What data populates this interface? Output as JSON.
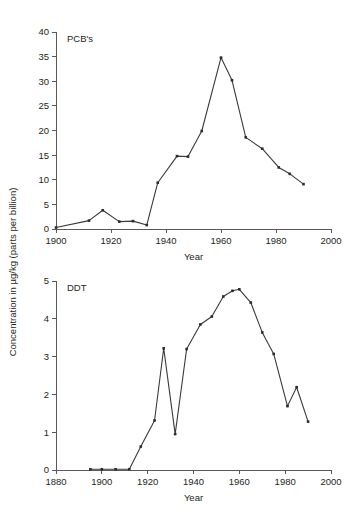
{
  "figure": {
    "y_axis_title": "Concentration in µg/kg (parts per billion)",
    "x_axis_title_top": "Year",
    "x_axis_title_bottom": "Year",
    "line_color": "#3a3a3a",
    "axis_color": "#595959",
    "text_color": "#231f20",
    "background": "#ffffff"
  },
  "chart_data": [
    {
      "type": "line",
      "title": "PCB's",
      "xlabel": "Year",
      "ylabel": "Concentration in µg/kg (parts per billion)",
      "xlim": [
        1900,
        2000
      ],
      "ylim": [
        0,
        40
      ],
      "xticks": [
        1900,
        1920,
        1940,
        1960,
        1980,
        2000
      ],
      "yticks": [
        0,
        5,
        10,
        15,
        20,
        25,
        30,
        35,
        40
      ],
      "xtick_labels": [
        "1900",
        "1920",
        "1940",
        "1960",
        "1980",
        "2000"
      ],
      "ytick_labels": [
        "0",
        "5",
        "10",
        "15",
        "20",
        "25",
        "30",
        "35",
        "40"
      ],
      "grid": false,
      "legend": "none",
      "markers": true,
      "series": [
        {
          "name": "PCB's",
          "x": [
            1900,
            1912,
            1917,
            1923,
            1928,
            1933,
            1937,
            1944,
            1948,
            1953,
            1960,
            1964,
            1969,
            1975,
            1981,
            1985,
            1990
          ],
          "y": [
            0.3,
            1.7,
            3.8,
            1.5,
            1.6,
            0.8,
            9.4,
            14.8,
            14.7,
            19.9,
            34.8,
            30.2,
            18.6,
            16.3,
            12.5,
            11.2,
            9.1
          ]
        }
      ]
    },
    {
      "type": "line",
      "title": "DDT",
      "xlabel": "Year",
      "ylabel": "Concentration in µg/kg (parts per billion)",
      "xlim": [
        1880,
        2000
      ],
      "ylim": [
        0,
        5
      ],
      "xticks": [
        1880,
        1900,
        1920,
        1940,
        1960,
        1980,
        2000
      ],
      "yticks": [
        0,
        1,
        2,
        3,
        4,
        5
      ],
      "xtick_labels": [
        "1880",
        "1900",
        "1920",
        "1940",
        "1960",
        "1980",
        "2000"
      ],
      "ytick_labels": [
        "0",
        "1",
        "2",
        "3",
        "4",
        "5"
      ],
      "grid": false,
      "legend": "none",
      "markers": true,
      "series": [
        {
          "name": "DDT",
          "x": [
            1895,
            1900,
            1906,
            1912,
            1917,
            1923,
            1927,
            1932,
            1937,
            1943,
            1948,
            1953,
            1957,
            1960,
            1965,
            1970,
            1975,
            1981,
            1985,
            1990
          ],
          "y": [
            0.02,
            0.02,
            0.02,
            0.02,
            0.62,
            1.31,
            3.22,
            0.95,
            3.2,
            3.85,
            4.06,
            4.59,
            4.74,
            4.78,
            4.43,
            3.64,
            3.07,
            1.69,
            2.19,
            1.28
          ]
        }
      ]
    }
  ]
}
